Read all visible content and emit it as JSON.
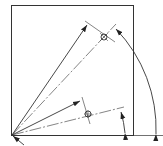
{
  "diagram": {
    "type": "technical-drawing",
    "colors": {
      "stroke": "#333333",
      "background": "#ffffff"
    },
    "plate": {
      "x": 11,
      "y": 5,
      "width": 123,
      "height": 130
    },
    "origin": {
      "x": 12,
      "y": 135
    },
    "holes": [
      {
        "name": "upper-hole",
        "x": 104,
        "y": 37
      },
      {
        "name": "lower-hole",
        "x": 88,
        "y": 114
      }
    ],
    "labels": []
  }
}
